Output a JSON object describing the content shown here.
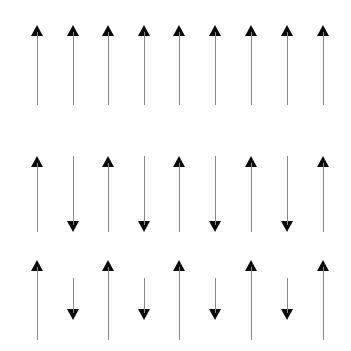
{
  "figure": {
    "width": 351,
    "height": 351,
    "background_color": "#ffffff",
    "shaft_color": "#8a8a8a",
    "head_color": "#0a0a0a",
    "arrow_count_per_row": 9,
    "column_x": [
      31,
      67,
      102,
      138,
      173,
      209,
      245,
      281,
      317
    ],
    "rows": [
      {
        "name": "row-1-all-up",
        "top": 25,
        "height": 82,
        "arrows": [
          {
            "direction": "up",
            "length": 80
          },
          {
            "direction": "up",
            "length": 80
          },
          {
            "direction": "up",
            "length": 80
          },
          {
            "direction": "up",
            "length": 80
          },
          {
            "direction": "up",
            "length": 80
          },
          {
            "direction": "up",
            "length": 80
          },
          {
            "direction": "up",
            "length": 80
          },
          {
            "direction": "up",
            "length": 80
          },
          {
            "direction": "up",
            "length": 80
          }
        ]
      },
      {
        "name": "row-2-alternating-equal",
        "top": 156,
        "height": 80,
        "arrows": [
          {
            "direction": "up",
            "length": 76
          },
          {
            "direction": "down",
            "length": 76
          },
          {
            "direction": "up",
            "length": 76
          },
          {
            "direction": "down",
            "length": 76
          },
          {
            "direction": "up",
            "length": 76
          },
          {
            "direction": "down",
            "length": 76
          },
          {
            "direction": "up",
            "length": 76
          },
          {
            "direction": "down",
            "length": 76
          },
          {
            "direction": "up",
            "length": 76
          }
        ]
      },
      {
        "name": "row-3-alternating-unequal",
        "top": 260,
        "height": 84,
        "arrows": [
          {
            "direction": "up",
            "length": 80,
            "offset": 0
          },
          {
            "direction": "down",
            "length": 42,
            "offset": 18
          },
          {
            "direction": "up",
            "length": 80,
            "offset": 0
          },
          {
            "direction": "down",
            "length": 42,
            "offset": 18
          },
          {
            "direction": "up",
            "length": 80,
            "offset": 0
          },
          {
            "direction": "down",
            "length": 42,
            "offset": 18
          },
          {
            "direction": "up",
            "length": 80,
            "offset": 0
          },
          {
            "direction": "down",
            "length": 42,
            "offset": 18
          },
          {
            "direction": "up",
            "length": 80,
            "offset": 0
          }
        ]
      }
    ]
  }
}
